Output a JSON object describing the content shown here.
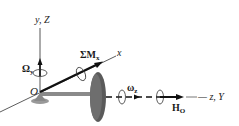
{
  "diagram": {
    "labels": {
      "vertical_axis": "y, Z",
      "omega_y": "Ω",
      "omega_y_sub": "y",
      "origin": "O",
      "sum_moment": "ΣM",
      "sum_moment_sub": "x",
      "x_axis": "x",
      "omega_z": "ω",
      "omega_z_sub": "z",
      "angular_momentum": "H",
      "angular_momentum_sub": "O",
      "horizontal_axis": "— z, Y"
    },
    "colors": {
      "axis": "#333333",
      "arrow": "#111111",
      "disk": "#5a5a5a",
      "rod": "#8a8a8a"
    }
  }
}
